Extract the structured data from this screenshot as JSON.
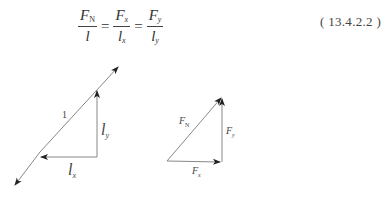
{
  "equation": {
    "terms": [
      {
        "num_var": "F",
        "num_sub": "N",
        "den_var": "l",
        "den_sub": ""
      },
      {
        "num_var": "F",
        "num_sub": "x",
        "den_var": "l",
        "den_sub": "x"
      },
      {
        "num_var": "F",
        "num_sub": "y",
        "den_var": "l",
        "den_sub": "y"
      }
    ],
    "equals": "=",
    "number": "( 13.4.2.2 )"
  },
  "left_diagram": {
    "hyp_label": "1",
    "ly_var": "l",
    "ly_sub": "y",
    "lx_var": "l",
    "lx_sub": "x"
  },
  "right_diagram": {
    "fn_var": "F",
    "fn_sub": "N",
    "fy_var": "F",
    "fy_sub": "y",
    "fx_var": "F",
    "fx_sub": "x"
  },
  "colors": {
    "line": "#888888",
    "arrow": "#222222",
    "text": "#444444"
  }
}
